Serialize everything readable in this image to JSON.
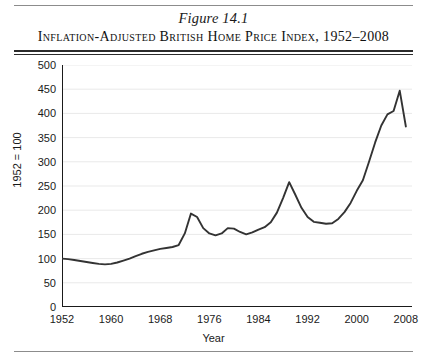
{
  "figure": {
    "number_label": "Figure 14.1",
    "title": "Inflation-Adjusted British Home Price Index, 1952–2008"
  },
  "style": {
    "line_color": "#333333",
    "grid_color": "#e9e9e9",
    "axis_color": "#1a1a1a",
    "background": "#ffffff"
  },
  "chart_data": {
    "type": "line",
    "title": "Inflation-Adjusted British Home Price Index, 1952–2008",
    "subtitle": "Figure 14.1",
    "xlabel": "Year",
    "ylabel": "1952 = 100",
    "xlim": [
      1952,
      2009
    ],
    "ylim": [
      0,
      500
    ],
    "ytick_step": 50,
    "yticks": [
      500,
      450,
      400,
      350,
      300,
      250,
      200,
      150,
      100,
      50,
      0
    ],
    "ytick_labels": [
      "500",
      "450",
      "400",
      "350",
      "300",
      "250",
      "200",
      "150",
      "100",
      "50",
      "0"
    ],
    "xticks": [
      1952,
      1960,
      1968,
      1976,
      1984,
      1992,
      2000,
      2008
    ],
    "xtick_labels": [
      "1952",
      "1960",
      "1968",
      "1976",
      "1984",
      "1992",
      "2000",
      "2008"
    ],
    "minor_xtick_interval": 1,
    "grid": "horizontal",
    "legend": "none",
    "series": [
      {
        "name": "Inflation-adjusted British home price index (1952 = 100)",
        "x": [
          1952,
          1953,
          1954,
          1955,
          1956,
          1957,
          1958,
          1959,
          1960,
          1961,
          1962,
          1963,
          1964,
          1965,
          1966,
          1967,
          1968,
          1969,
          1970,
          1971,
          1972,
          1973,
          1974,
          1975,
          1976,
          1977,
          1978,
          1979,
          1980,
          1981,
          1982,
          1983,
          1984,
          1985,
          1986,
          1987,
          1988,
          1989,
          1990,
          1991,
          1992,
          1993,
          1994,
          1995,
          1996,
          1997,
          1998,
          1999,
          2000,
          2001,
          2002,
          2003,
          2004,
          2005,
          2006,
          2007,
          2008
        ],
        "values": [
          100,
          99,
          97,
          95,
          93,
          91,
          89,
          88,
          89,
          92,
          96,
          100,
          105,
          110,
          114,
          117,
          120,
          122,
          124,
          128,
          152,
          193,
          186,
          163,
          152,
          148,
          152,
          163,
          162,
          155,
          150,
          154,
          160,
          165,
          175,
          195,
          225,
          258,
          232,
          205,
          186,
          176,
          174,
          172,
          173,
          182,
          196,
          215,
          240,
          262,
          300,
          340,
          375,
          398,
          405,
          447,
          373
        ]
      }
    ],
    "annotations": [
      {
        "label": "first major peak",
        "year": 1973,
        "value": 193
      },
      {
        "label": "late-1980s boom peak",
        "year": 1989,
        "value": 258
      },
      {
        "label": "mid-1990s trough",
        "year": 1995,
        "value": 172
      },
      {
        "label": "all-time peak",
        "year": 2007,
        "value": 447
      },
      {
        "label": "post-peak decline",
        "year": 2008,
        "value": 373
      }
    ]
  }
}
